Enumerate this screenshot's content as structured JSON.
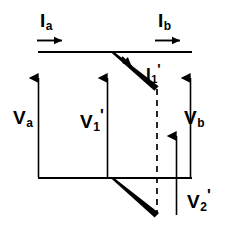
{
  "figure": {
    "background_color": "#ffffff",
    "stroke_color": "#000000",
    "width": 229,
    "height": 236
  },
  "labels": {
    "current_a": {
      "base": "I",
      "sub": "a",
      "prime": ""
    },
    "current_b": {
      "base": "I",
      "sub": "b",
      "prime": ""
    },
    "current_1_prime": {
      "base": "I",
      "sub": "1",
      "prime": "'"
    },
    "voltage_a": {
      "base": "V",
      "sub": "a",
      "prime": ""
    },
    "voltage_1_prime": {
      "base": "V",
      "sub": "1",
      "prime": "'"
    },
    "voltage_2_prime": {
      "base": "V",
      "sub": "2",
      "prime": "'"
    },
    "voltage_b": {
      "base": "V",
      "sub": "b",
      "prime": ""
    }
  },
  "elements": {
    "top_rail": "top-horizontal-conductor",
    "bottom_rail": "bottom-horizontal-conductor",
    "dashed_divider": "dashed-vertical-reference-line",
    "upper_branch": "upper-tapered-branch",
    "lower_branch": "lower-tapered-branch",
    "current_a_arrow": "current-a-direction-arrow",
    "current_b_arrow": "current-b-direction-arrow",
    "current_1_prime_arrow": "current-1-prime-direction-arrow",
    "voltage_a_arrow": "voltage-a-polarity-arrow",
    "voltage_1_prime_arrow": "voltage-1-prime-polarity-arrow",
    "voltage_2_prime_arrow": "voltage-2-prime-polarity-arrow",
    "voltage_b_arrow": "voltage-b-polarity-arrow"
  }
}
